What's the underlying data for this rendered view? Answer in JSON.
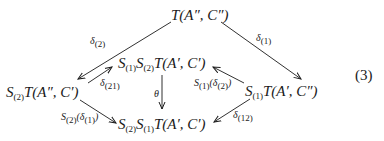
{
  "diagram": {
    "type": "commutative-diagram",
    "equation_number": "(3)",
    "nodes": {
      "top": {
        "text": "T(A″, C″)"
      },
      "left": {
        "prefix": "S",
        "prefix_sub": "(2)",
        "text": "T(A″, C′)"
      },
      "middle": {
        "p1": "S",
        "p1_sub": "(1)",
        "p2": "S",
        "p2_sub": "(2)",
        "text": "T(A′, C′)"
      },
      "right": {
        "prefix": "S",
        "prefix_sub": "(1)",
        "text": "T(A′, C″)"
      },
      "bottom": {
        "p1": "S",
        "p1_sub": "(2)",
        "p2": "S",
        "p2_sub": "(1)",
        "text": "T(A′, C′)"
      }
    },
    "labels": {
      "top_left": {
        "sym": "δ",
        "sub": "(2)"
      },
      "top_right": {
        "sym": "δ",
        "sub": "(1)"
      },
      "left_middle": {
        "sym": "δ",
        "sub": "(21)"
      },
      "middle_bottom": {
        "sym": "θ"
      },
      "right_middle": {
        "sym": "S",
        "sub": "(1)",
        "arg_sym": "δ",
        "arg_sub": "(2)"
      },
      "left_bottom": {
        "sym": "S",
        "sub": "(2)",
        "arg_sym": "δ",
        "arg_sub": "(1)"
      },
      "right_bottom": {
        "sym": "δ",
        "sub": "(12)"
      }
    },
    "edges": [
      {
        "from": "top",
        "to": "left",
        "label": "δ(2)"
      },
      {
        "from": "top",
        "to": "right",
        "label": "δ(1)"
      },
      {
        "from": "left",
        "to": "middle",
        "label": "δ(21)"
      },
      {
        "from": "right",
        "to": "middle",
        "label": "S(1)(δ(2))"
      },
      {
        "from": "middle",
        "to": "bottom",
        "label": "θ"
      },
      {
        "from": "left",
        "to": "bottom",
        "label": "S(2)(δ(1))"
      },
      {
        "from": "right",
        "to": "bottom",
        "label": "δ(12)"
      }
    ]
  }
}
